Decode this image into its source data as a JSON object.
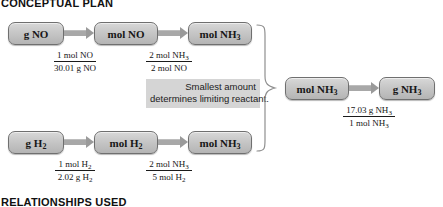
{
  "headings": {
    "conceptual_plan": "CONCEPTUAL PLAN",
    "relationships_used": "RELATIONSHIPS USED"
  },
  "nodes": {
    "g_no": "g NO",
    "mol_no": "mol NO",
    "mol_nh3_a": "mol NH3",
    "g_h2": "g H2",
    "mol_h2": "mol H2",
    "mol_nh3_b": "mol NH3",
    "mol_nh3_c": "mol NH3",
    "g_nh3": "g NH3"
  },
  "factors": {
    "f1": {
      "numerator": "1 mol NO",
      "denominator": "30.01 g NO"
    },
    "f2": {
      "numerator": "2 mol NH3",
      "denominator": "2 mol NO"
    },
    "f3": {
      "numerator": "1 mol H2",
      "denominator": "2.02 g H2"
    },
    "f4": {
      "numerator": "2 mol NH3",
      "denominator": "5 mol H2"
    },
    "f5": {
      "numerator": "17.03 g NH3",
      "denominator": "1 mol NH3"
    }
  },
  "note": {
    "line1": "Smallest amount",
    "line2": "determines limiting reactant."
  },
  "colors": {
    "node_fill_top": "#d8d8d8",
    "node_fill_bottom": "#b4b4b4",
    "node_border": "#6f6f6f",
    "arrow": "#a8a8a8",
    "note_background": "#d5d5d5",
    "text": "#171717",
    "page_background": "#ffffff"
  }
}
